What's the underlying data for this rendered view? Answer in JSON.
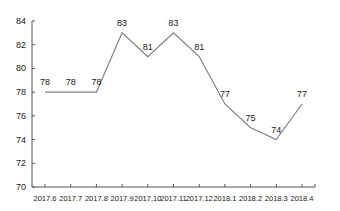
{
  "chart_data": {
    "type": "line",
    "title": "",
    "xlabel": "",
    "ylabel": "",
    "categories": [
      "2017.6",
      "2017.7",
      "2017.8",
      "2017.9",
      "2017.10",
      "2017.11",
      "2017.12",
      "2018.1",
      "2018.2",
      "2018.3",
      "2018.4"
    ],
    "series": [
      {
        "name": "",
        "values": [
          78,
          78,
          78,
          83,
          81,
          83,
          81,
          77,
          75,
          74,
          77
        ]
      }
    ],
    "ylim": [
      70,
      84
    ],
    "yticks": [
      70,
      72,
      74,
      76,
      78,
      80,
      82,
      84
    ],
    "grid": false,
    "legend": "none",
    "data_labels": true,
    "line_color": "#808080"
  }
}
